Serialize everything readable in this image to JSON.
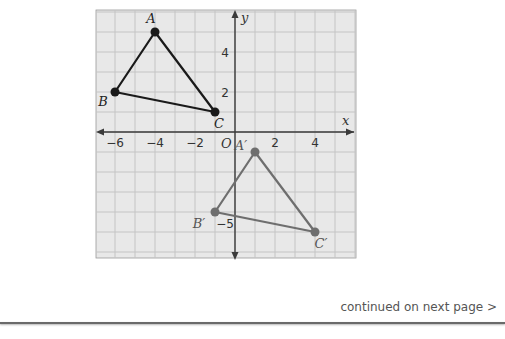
{
  "graph": {
    "origin_px": [
      235,
      132
    ],
    "unit_px": 20,
    "grid": {
      "left": 96,
      "top": 10,
      "right": 356,
      "bottom": 258,
      "bg": "#e8e8e8",
      "line": "#c4c4c4",
      "border": "#9a9a9a"
    },
    "axes": {
      "x_label": "x",
      "y_label": "y",
      "origin_label": "O",
      "color": "#3a3a3a"
    },
    "x_ticks": [
      {
        "value": -6,
        "label": "−6"
      },
      {
        "value": -4,
        "label": "−4"
      },
      {
        "value": -2,
        "label": "−2"
      },
      {
        "value": 2,
        "label": "2"
      },
      {
        "value": 4,
        "label": "4"
      }
    ],
    "y_ticks": [
      {
        "value": 4,
        "label": "4"
      },
      {
        "value": 2,
        "label": "2"
      },
      {
        "value": -5,
        "label": "−5"
      }
    ],
    "triangles": [
      {
        "name": "triangle-abc",
        "color": "#1a1a1a",
        "points": [
          {
            "label": "A",
            "x": -4,
            "y": 5,
            "lx": -4,
            "ly": -9
          },
          {
            "label": "B",
            "x": -6,
            "y": 2,
            "lx": -12,
            "ly": 14
          },
          {
            "label": "C",
            "x": -1,
            "y": 1,
            "lx": 4,
            "ly": 16
          }
        ]
      },
      {
        "name": "triangle-a-prime-b-prime-c-prime",
        "color": "#6e6e6e",
        "points": [
          {
            "label": "A′",
            "x": 1,
            "y": -1,
            "lx": -14,
            "ly": -2
          },
          {
            "label": "B′",
            "x": -1,
            "y": -4,
            "lx": -16,
            "ly": 16
          },
          {
            "label": "C′",
            "x": 4,
            "y": -5,
            "lx": 6,
            "ly": 16
          }
        ]
      }
    ]
  },
  "footer": {
    "continued_text": "continued on next page >"
  }
}
